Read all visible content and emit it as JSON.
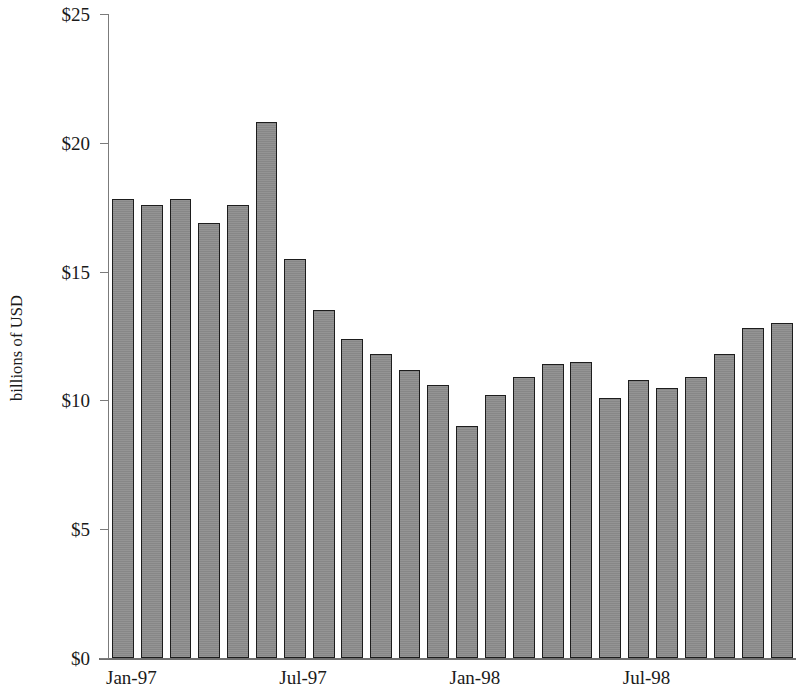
{
  "chart_data": {
    "type": "bar",
    "title": "",
    "subtitle": "",
    "xlabel": "",
    "ylabel": "billions of USD",
    "ylim": [
      0,
      25
    ],
    "ytick_values": [
      0,
      5,
      10,
      15,
      20,
      25
    ],
    "ytick_labels": [
      "$0",
      "$5",
      "$10",
      "$15",
      "$20",
      "$25"
    ],
    "grid": false,
    "legend": null,
    "bar_color": "#8e8e8e",
    "bar_edge_color": "#1d1d1d",
    "categories": [
      "Jan-97",
      "Feb-97",
      "Mar-97",
      "Apr-97",
      "May-97",
      "Jun-97",
      "Jul-97",
      "Aug-97",
      "Sep-97",
      "Oct-97",
      "Nov-97",
      "Dec-97",
      "Jan-98",
      "Feb-98",
      "Mar-98",
      "Apr-98",
      "May-98",
      "Jun-98",
      "Jul-98",
      "Aug-98",
      "Sep-98",
      "Oct-98",
      "Nov-98",
      "Dec-98"
    ],
    "values": [
      17.8,
      17.6,
      17.8,
      16.9,
      17.6,
      20.8,
      15.5,
      13.5,
      12.4,
      11.8,
      11.2,
      10.6,
      9.0,
      10.2,
      10.9,
      11.4,
      11.5,
      10.1,
      10.8,
      10.5,
      10.9,
      11.8,
      12.8,
      13.0
    ],
    "xtick_labels": [
      "Jan-97",
      "Jul-97",
      "Jan-98",
      "Jul-98"
    ],
    "xtick_indices": [
      0,
      6,
      12,
      18
    ]
  }
}
